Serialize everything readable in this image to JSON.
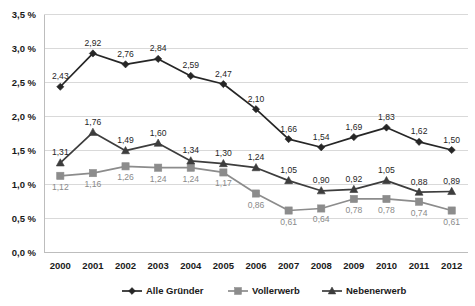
{
  "chart_data": {
    "type": "line",
    "title": "",
    "subtitle": "",
    "xlabel": "",
    "ylabel": "",
    "categories": [
      "2000",
      "2001",
      "2002",
      "2003",
      "2004",
      "2005",
      "2006",
      "2007",
      "2008",
      "2009",
      "2010",
      "2011",
      "2012"
    ],
    "ylim": [
      0.0,
      3.5
    ],
    "ytick_values": [
      0.0,
      0.5,
      1.0,
      1.5,
      2.0,
      2.5,
      3.0,
      3.5
    ],
    "ytick_labels": [
      "0,0 %",
      "0,5 %",
      "1,0 %",
      "1,5 %",
      "2,0 %",
      "2,5 %",
      "3,0 %",
      "3,5 %"
    ],
    "grid": true,
    "legend_position": "bottom",
    "series": [
      {
        "name": "Alle Gründer",
        "marker": "diamond",
        "color": "#262626",
        "values": [
          2.43,
          2.92,
          2.76,
          2.84,
          2.59,
          2.47,
          2.1,
          1.66,
          1.54,
          1.69,
          1.83,
          1.62,
          1.5
        ],
        "labels": [
          "2,43",
          "2,92",
          "2,76",
          "2,84",
          "2,59",
          "2,47",
          "2,10",
          "1,66",
          "1,54",
          "1,69",
          "1,83",
          "1,62",
          "1,50"
        ]
      },
      {
        "name": "Vollerwerb",
        "marker": "square",
        "color": "#8c8c8c",
        "values": [
          1.12,
          1.16,
          1.26,
          1.24,
          1.24,
          1.17,
          0.86,
          0.61,
          0.64,
          0.78,
          0.78,
          0.74,
          0.61
        ],
        "labels": [
          "1,12",
          "1,16",
          "1,26",
          "1,24",
          "1,24",
          "1,17",
          "0,86",
          "0,61",
          "0,64",
          "0,78",
          "0,78",
          "0,74",
          "0,61"
        ]
      },
      {
        "name": "Nebenerwerb",
        "marker": "triangle",
        "color": "#3d3d3d",
        "values": [
          1.31,
          1.76,
          1.49,
          1.6,
          1.34,
          1.3,
          1.24,
          1.05,
          0.9,
          0.92,
          1.05,
          0.88,
          0.89
        ],
        "labels": [
          "1,31",
          "1,76",
          "1,49",
          "1,60",
          "1,34",
          "1,30",
          "1,24",
          "1,05",
          "0,90",
          "0,92",
          "1,05",
          "0,88",
          "0,89"
        ]
      }
    ]
  },
  "legend": {
    "items": [
      {
        "label": "Alle Gründer"
      },
      {
        "label": "Vollerwerb"
      },
      {
        "label": "Nebenerwerb"
      }
    ]
  },
  "colors": {
    "series_dark": "#262626",
    "series_gray": "#8c8c8c",
    "series_mid": "#3d3d3d",
    "gridline": "#d9d9d9",
    "background": "#ffffff"
  }
}
